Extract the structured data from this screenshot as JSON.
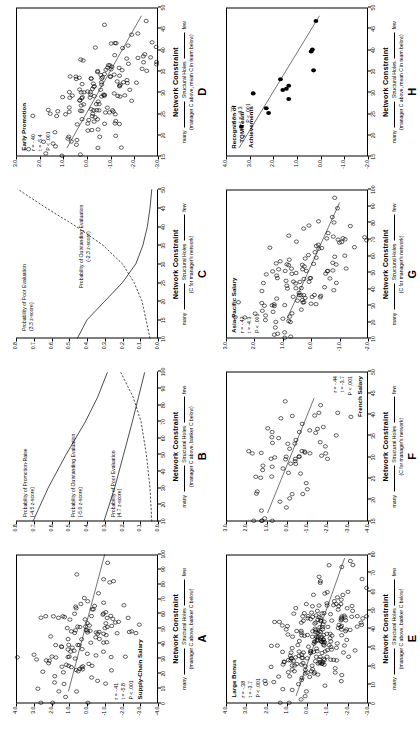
{
  "figure": {
    "orientation": "rotated-90-ccw",
    "panel_count": 8
  },
  "axis_caption": {
    "title": "Network Constraint",
    "left_word": "many",
    "middle": "Structural Holes",
    "right_word": "few",
    "sub_manager_network": "(C for manager's network)",
    "sub_manager_above_banker_below": "(manager C above, banker C below)",
    "sub_manager_above_mean_team": "(manager C above, mean C in team below)"
  },
  "chart_data": [
    {
      "id": "A",
      "letter": "A",
      "type": "scatter",
      "title": "Supply-Chain Salary",
      "xlabel": "Network Constraint",
      "ylabel": "",
      "xlim": [
        0,
        100
      ],
      "ylim": [
        -4.0,
        4.0
      ],
      "xticks": [
        "0",
        "10",
        "20",
        "30",
        "40",
        "50",
        "60",
        "70",
        "80",
        "90",
        "100"
      ],
      "yticks": [
        "4.0",
        "3.0",
        "2.0",
        "1.0",
        "0.0",
        "-1.0",
        "-2.0",
        "-3.0",
        "-4.0"
      ],
      "stats": "r = -.41\nt = -5.8\nP < .001",
      "r": -0.41,
      "t": -5.8,
      "p": "< .001",
      "fit_line": {
        "x0": 8,
        "y0": 1.05,
        "x1": 100,
        "y1": -1.0
      },
      "marker": "open-circle",
      "n_points": 125
    },
    {
      "id": "B",
      "letter": "B",
      "type": "line",
      "title": "",
      "xlabel": "Network Constraint",
      "xlim": [
        10,
        100
      ],
      "ylim": [
        0.0,
        0.8
      ],
      "xticks": [
        "10",
        "20",
        "30",
        "40",
        "50",
        "60",
        "70",
        "80",
        "90",
        "100"
      ],
      "yticks": [
        "0.8",
        "0.7",
        "0.6",
        "0.5",
        "0.4",
        "0.3",
        "0.2",
        "0.1",
        "0.0"
      ],
      "curves": [
        {
          "name": "Probability of Promotion-Raise",
          "note": "(-4.5 z-score)",
          "style": "solid",
          "points": [
            [
              10,
              0.705
            ],
            [
              30,
              0.62
            ],
            [
              50,
              0.52
            ],
            [
              70,
              0.41
            ],
            [
              85,
              0.34
            ],
            [
              100,
              0.285
            ]
          ]
        },
        {
          "name": "Probability of Outstanding Evaluation",
          "note": "(-5.0 z-score)",
          "style": "solid",
          "points": [
            [
              10,
              0.305
            ],
            [
              30,
              0.245
            ],
            [
              50,
              0.195
            ],
            [
              70,
              0.145
            ],
            [
              85,
              0.11
            ],
            [
              100,
              0.075
            ]
          ]
        },
        {
          "name": "Probability of Poor Evaluation",
          "note": "(4.7 z-score)",
          "style": "dashed",
          "points": [
            [
              10,
              0.035
            ],
            [
              30,
              0.045
            ],
            [
              50,
              0.065
            ],
            [
              70,
              0.095
            ],
            [
              85,
              0.14
            ],
            [
              100,
              0.21
            ]
          ]
        }
      ]
    },
    {
      "id": "C",
      "letter": "C",
      "type": "line",
      "title": "",
      "xlabel": "Network Constraint",
      "xlim": [
        10,
        50
      ],
      "ylim": [
        0.0,
        0.8
      ],
      "xticks": [
        "10",
        "15",
        "20",
        "25",
        "30",
        "35",
        "40",
        "45",
        "50"
      ],
      "yticks": [
        "0.8",
        "0.7",
        "0.6",
        "0.5",
        "0.4",
        "0.3",
        "0.2",
        "0.1",
        "0.0"
      ],
      "curves": [
        {
          "name": "Probability of Poor Evaluation",
          "note": "(3.3 z-score)",
          "style": "dashed",
          "points": [
            [
              10,
              0.045
            ],
            [
              20,
              0.09
            ],
            [
              25,
              0.135
            ],
            [
              30,
              0.2
            ],
            [
              35,
              0.31
            ],
            [
              40,
              0.46
            ],
            [
              45,
              0.63
            ],
            [
              50,
              0.79
            ]
          ]
        },
        {
          "name": "Probability of Outstanding Evaluation",
          "note": "(-2.3 z-score)",
          "style": "solid",
          "points": [
            [
              10,
              0.455
            ],
            [
              15,
              0.4
            ],
            [
              20,
              0.3
            ],
            [
              25,
              0.2
            ],
            [
              30,
              0.125
            ],
            [
              35,
              0.085
            ],
            [
              40,
              0.06
            ],
            [
              45,
              0.045
            ],
            [
              50,
              0.035
            ]
          ]
        }
      ]
    },
    {
      "id": "D",
      "letter": "D",
      "type": "scatter",
      "title": "Early Promotion",
      "xlabel": "Network Constraint",
      "xlim": [
        15,
        50
      ],
      "ylim": [
        -3.0,
        3.0
      ],
      "xticks": [
        "15",
        "20",
        "25",
        "30",
        "35",
        "40",
        "45",
        "50"
      ],
      "yticks": [
        "3.0",
        "2.0",
        "1.0",
        "0.0",
        "-1.0",
        "-2.0",
        "-3.0"
      ],
      "stats": "r = -.40\nt = -5.4\nP < .001",
      "r": -0.4,
      "t": -5.4,
      "p": "< .001",
      "fit_line": {
        "x0": 17,
        "y0": 0.85,
        "x1": 48,
        "y1": -2.3
      },
      "marker": "open-circle",
      "n_points": 150
    },
    {
      "id": "E",
      "letter": "E",
      "type": "scatter",
      "title": "Large Bonus",
      "xlabel": "Network Constraint",
      "xlim": [
        0,
        80
      ],
      "ylim": [
        -3.0,
        4.0
      ],
      "xticks": [
        "0",
        "10",
        "20",
        "30",
        "40",
        "50",
        "60",
        "70",
        "80"
      ],
      "yticks": [
        "4.0",
        "3.0",
        "2.0",
        "1.0",
        "0.0",
        "-1.0",
        "-2.0",
        "-3.0"
      ],
      "stats": "r = -.38\nt = -3.7\nP < .001",
      "r": -0.38,
      "t": -3.7,
      "p": "< .001",
      "fit_line": {
        "x0": 4,
        "y0": 0.55,
        "x1": 78,
        "y1": -1.85
      },
      "marker": "open-circle",
      "n_points": 230
    },
    {
      "id": "F",
      "letter": "F",
      "type": "scatter",
      "title": "French Salary",
      "xlabel": "Network Constraint",
      "xlim": [
        15,
        50
      ],
      "ylim": [
        -4.0,
        3.0
      ],
      "xticks": [
        "15",
        "20",
        "25",
        "30",
        "35",
        "40",
        "45",
        "50"
      ],
      "yticks": [
        "3.0",
        "2.0",
        "1.0",
        "0.0",
        "-1.0",
        "-2.0",
        "-3.0",
        "-4.0"
      ],
      "stats": "r = -.44\nt = -3.7\nP < .001",
      "r": -0.44,
      "t": -3.7,
      "p": "< .001",
      "fit_line": {
        "x0": 17,
        "y0": 0.95,
        "x1": 44,
        "y1": -1.35
      },
      "marker": "open-circle",
      "n_points": 70
    },
    {
      "id": "G",
      "letter": "G",
      "type": "scatter",
      "title": "Asia-Pacific Salary",
      "xlabel": "Network Constraint",
      "xlim": [
        10,
        100
      ],
      "ylim": [
        -2.0,
        3.0
      ],
      "xticks": [
        "10",
        "20",
        "30",
        "40",
        "50",
        "60",
        "70",
        "80",
        "90",
        "100"
      ],
      "yticks": [
        "3.0",
        "2.0",
        "1.0",
        "0.0",
        "-1.0",
        "-2.0"
      ],
      "stats": "r = -.42\nt = -4.3\nP < .001",
      "r": -0.42,
      "t": -4.3,
      "p": "< .001",
      "fit_line": {
        "x0": 22,
        "y0": 0.85,
        "x1": 92,
        "y1": -1.0
      },
      "marker": "open-circle",
      "n_points": 120
    },
    {
      "id": "H",
      "letter": "H",
      "type": "scatter",
      "title": "Recognition of\nTQM Team\nAchievements",
      "xlabel": "Network Constraint",
      "xlim": [
        15,
        50
      ],
      "ylim": [
        -2.0,
        4.0
      ],
      "xticks": [
        "15",
        "20",
        "25",
        "30",
        "35",
        "40",
        "45",
        "50"
      ],
      "yticks": [
        "4.0",
        "3.0",
        "2.0",
        "1.0",
        "0.0",
        "-1.0",
        "-2.0"
      ],
      "stats": "r = -.79\nt = -4.3\nP < .001",
      "r": -0.79,
      "t": -4.3,
      "p": "< .001",
      "fit_line": {
        "x0": 17,
        "y0": 3.45,
        "x1": 48,
        "y1": 0.05
      },
      "marker": "filled-circle",
      "points": [
        [
          22,
          3.35
        ],
        [
          25.2,
          2.2
        ],
        [
          26.3,
          2.3
        ],
        [
          28.5,
          1.35
        ],
        [
          29.8,
          2.85
        ],
        [
          30.6,
          1.6
        ],
        [
          30.9,
          1.45
        ],
        [
          31.6,
          1.35
        ],
        [
          33.1,
          1.7
        ],
        [
          35.2,
          0.3
        ],
        [
          39.6,
          0.4
        ],
        [
          40.1,
          0.35
        ],
        [
          46.8,
          0.2
        ]
      ],
      "n_points": 13
    }
  ]
}
